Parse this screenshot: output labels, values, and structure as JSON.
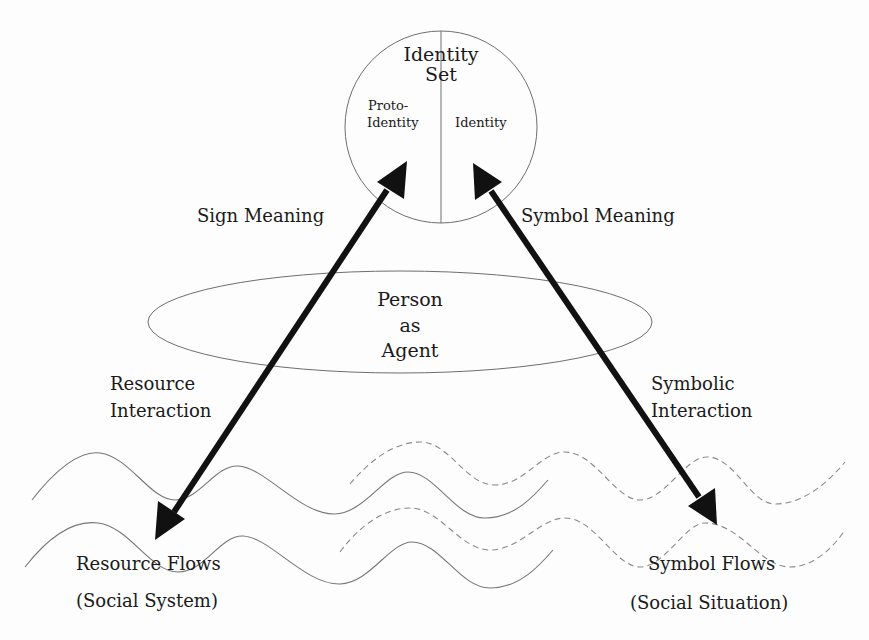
{
  "diagram": {
    "identity_set": {
      "title_line1": "Identity",
      "title_line2": "Set",
      "left_half_line1": "Proto-",
      "left_half_line2": "Identity",
      "right_half": "Identity"
    },
    "person": {
      "line1": "Person",
      "line2": "as",
      "line3": "Agent"
    },
    "edges": {
      "sign_meaning": "Sign Meaning",
      "symbol_meaning": "Symbol Meaning",
      "resource_interaction_line1": "Resource",
      "resource_interaction_line2": "Interaction",
      "symbolic_interaction_line1": "Symbolic",
      "symbolic_interaction_line2": "Interaction"
    },
    "flows": {
      "resource_title": "Resource Flows",
      "resource_subtitle": "(Social System)",
      "symbol_title": "Symbol Flows",
      "symbol_subtitle": "(Social Situation)"
    },
    "colors": {
      "background": "#fdfdfd",
      "arrow": "#111111",
      "outline": "#6e6e6e",
      "text": "#1a1a1a"
    }
  }
}
